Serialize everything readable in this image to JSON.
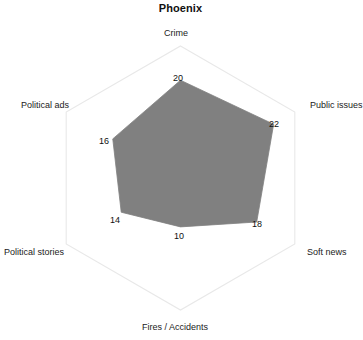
{
  "chart_data": {
    "type": "radar",
    "title": "Phoenix",
    "categories": [
      "Crime",
      "Public issues",
      "Soft news",
      "Fires / Accidents",
      "Political stories",
      "Political ads"
    ],
    "values": [
      20,
      22,
      18,
      10,
      14,
      16
    ],
    "value_labels": [
      "20",
      "22",
      "18",
      "10",
      "14",
      "16"
    ],
    "rmax": 27,
    "rmin": 0,
    "grid": false,
    "legend": "none",
    "fill_color": "#808080",
    "grid_color": "#e8e8e8",
    "xlabel": "",
    "ylabel": ""
  },
  "header": {
    "title": "Phoenix"
  },
  "axes": [
    {
      "label": "Crime",
      "value": "20",
      "label_x": 164,
      "label_y": 28,
      "value_x": 173,
      "value_y": 73
    },
    {
      "label": "Public issues",
      "value": "22",
      "label_x": 310,
      "label_y": 100,
      "value_x": 269,
      "value_y": 119
    },
    {
      "label": "Soft news",
      "value": "18",
      "label_x": 307,
      "label_y": 247,
      "value_x": 252,
      "value_y": 219
    },
    {
      "label": "Fires / Accidents",
      "value": "10",
      "label_x": 142,
      "label_y": 322,
      "value_x": 174,
      "value_y": 231
    },
    {
      "label": "Political stories",
      "value": "14",
      "label_x": 4,
      "label_y": 247,
      "value_x": 110,
      "value_y": 215
    },
    {
      "label": "Political ads",
      "value": "16",
      "label_x": 21,
      "label_y": 100,
      "value_x": 99,
      "value_y": 136
    }
  ]
}
